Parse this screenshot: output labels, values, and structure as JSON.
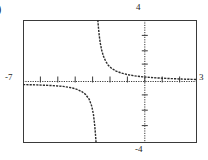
{
  "item_label": ")",
  "chart_data": {
    "type": "line",
    "title": "",
    "subtitle": "",
    "xlabel": "",
    "ylabel": "",
    "style": "graphing-calculator-window",
    "xlim": [
      -7,
      3
    ],
    "ylim": [
      -4,
      4
    ],
    "axis_tick_labels": {
      "top": "4",
      "bottom": "-4",
      "left": "-7",
      "right": "3"
    },
    "grid": false,
    "ticks": {
      "x_axis_ticks": true,
      "y_axis_ticks": true,
      "x_tick_spacing": 1,
      "y_tick_spacing": 1
    },
    "legend": null,
    "asymptotes": {
      "vertical": -2.75,
      "horizontal": 0
    },
    "series": [
      {
        "name": "left-branch",
        "comment": "branch below horizontal asymptote, left of vertical asymptote",
        "x": [
          -7.0,
          -6.6,
          -6.2,
          -5.8,
          -5.4,
          -5.0,
          -4.7,
          -4.4,
          -4.1,
          -3.85,
          -3.6,
          -3.4,
          -3.2,
          -3.05,
          -2.95,
          -2.88,
          -2.83,
          -2.8
        ],
        "y": [
          -0.2,
          -0.21,
          -0.22,
          -0.24,
          -0.26,
          -0.29,
          -0.32,
          -0.37,
          -0.44,
          -0.53,
          -0.67,
          -0.85,
          -1.15,
          -1.6,
          -2.15,
          -2.85,
          -3.5,
          -4.0
        ]
      },
      {
        "name": "right-branch",
        "comment": "branch above horizontal asymptote, right of vertical asymptote",
        "x": [
          -2.7,
          -2.66,
          -2.62,
          -2.56,
          -2.48,
          -2.38,
          -2.25,
          -2.1,
          -1.9,
          -1.65,
          -1.35,
          -1.0,
          -0.6,
          -0.15,
          0.35,
          0.9,
          1.5,
          2.1,
          2.7,
          3.0
        ],
        "y": [
          4.0,
          3.45,
          3.0,
          2.5,
          2.05,
          1.65,
          1.32,
          1.06,
          0.85,
          0.68,
          0.55,
          0.45,
          0.37,
          0.31,
          0.26,
          0.22,
          0.19,
          0.16,
          0.14,
          0.13
        ]
      }
    ],
    "colors": {
      "curve": "#2b2b2b",
      "axis": "#3a3a3a",
      "frame": "#3a3a3a",
      "background": "#ffffff"
    }
  }
}
